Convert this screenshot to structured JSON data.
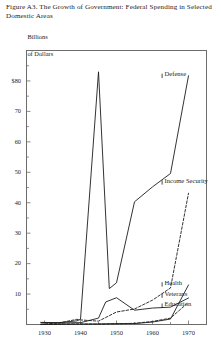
{
  "figure": {
    "caption": "Figure A3. The Growth of Government: Federal Spending in Selected Domestic Areas",
    "y_axis_unit_line1": "Billions",
    "y_axis_unit_line2": "of Dollars"
  },
  "chart_data": {
    "type": "line",
    "title": "Figure A3. The Growth of Government: Federal Spending in Selected Domestic Areas",
    "xlabel": "",
    "ylabel": "Billions of Dollars",
    "xlim": [
      1925,
      1975
    ],
    "ylim": [
      0,
      90
    ],
    "grid": false,
    "legend": "inline-right-labels",
    "x_ticks": [
      1930,
      1940,
      1950,
      1960,
      1970
    ],
    "x_tick_labels": [
      "1930",
      "1940",
      "1950",
      "1960",
      "1970"
    ],
    "x_minor_ticks": [
      1925,
      1935,
      1945,
      1955,
      1965,
      1975
    ],
    "y_ticks": [
      10,
      20,
      30,
      40,
      50,
      60,
      70,
      80
    ],
    "y_tick_labels": [
      "10",
      "20",
      "30",
      "40",
      "50",
      "60",
      "70",
      "$80"
    ],
    "y_minor_ticks": [
      5,
      15,
      25,
      35,
      45,
      55,
      65,
      75,
      85
    ],
    "series": [
      {
        "name": "Defense",
        "style": "solid",
        "color": "#1c1c1c",
        "label_x": 1963,
        "label_y": 82,
        "x": [
          1929,
          1934,
          1939,
          1940,
          1945,
          1948,
          1950,
          1955,
          1960,
          1965,
          1970
        ],
        "values": [
          0.7,
          0.6,
          1.2,
          1.7,
          83.0,
          11.8,
          13.7,
          40.3,
          45.2,
          49.6,
          81.7
        ]
      },
      {
        "name": "Income Security",
        "style": "dashed",
        "color": "#1c1c1c",
        "label_x": 1963,
        "label_y": 47,
        "x": [
          1929,
          1934,
          1939,
          1940,
          1945,
          1950,
          1955,
          1960,
          1965,
          1970
        ],
        "values": [
          0.1,
          0.5,
          1.7,
          1.5,
          1.1,
          4.1,
          5.1,
          8.0,
          12.0,
          43.1
        ]
      },
      {
        "name": "Health",
        "style": "solid",
        "color": "#1c1c1c",
        "label_x": 1963,
        "label_y": 13.5,
        "x": [
          1929,
          1934,
          1939,
          1940,
          1945,
          1950,
          1955,
          1960,
          1965,
          1970
        ],
        "values": [
          0.0,
          0.1,
          0.1,
          0.1,
          0.2,
          0.3,
          0.3,
          0.8,
          1.8,
          13.0
        ]
      },
      {
        "name": "Veterans",
        "style": "solid",
        "color": "#1c1c1c",
        "label_x": 1963,
        "label_y": 9.8,
        "x": [
          1929,
          1934,
          1939,
          1940,
          1945,
          1947,
          1950,
          1955,
          1960,
          1965,
          1970
        ],
        "values": [
          0.6,
          0.5,
          0.6,
          0.6,
          2.1,
          7.4,
          8.8,
          4.7,
          5.4,
          5.7,
          8.7
        ]
      },
      {
        "name": "Education",
        "style": "dashed",
        "color": "#1c1c1c",
        "label_x": 1963,
        "label_y": 6.5,
        "x": [
          1929,
          1934,
          1939,
          1940,
          1945,
          1950,
          1955,
          1960,
          1965,
          1970
        ],
        "values": [
          0.0,
          0.1,
          0.2,
          0.2,
          0.1,
          0.2,
          0.4,
          1.0,
          2.1,
          7.3
        ]
      }
    ]
  }
}
